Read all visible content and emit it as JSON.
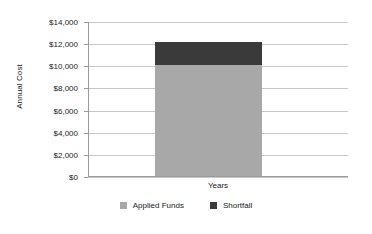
{
  "chart_data": {
    "type": "bar",
    "subtype": "stacked-column",
    "title": "",
    "xlabel": "Years",
    "ylabel": "Annual Cost",
    "categories": [
      "Years"
    ],
    "series": [
      {
        "name": "Applied Funds",
        "values": [
          10000
        ],
        "color": "#a8a8a8"
      },
      {
        "name": "Shortfall",
        "values": [
          2150
        ],
        "color": "#3a3a3a"
      }
    ],
    "stack_total": [
      12150
    ],
    "ylim": [
      0,
      14000
    ],
    "ytick_values": [
      14000,
      12000,
      10000,
      8000,
      6000,
      4000,
      2000,
      0
    ],
    "ytick_labels": [
      "$14,000",
      "$12,000",
      "$10,000",
      "$8,000",
      "$6,000",
      "$4,000",
      "$2,000",
      "$0"
    ],
    "grid": true,
    "grid_axis": "y",
    "legend": true,
    "legend_position": "bottom"
  },
  "legend": {
    "entries": [
      {
        "label": "Applied Funds",
        "color": "#a8a8a8"
      },
      {
        "label": "Shortfall",
        "color": "#3a3a3a"
      }
    ]
  },
  "axes": {
    "y_title": "Annual Cost",
    "x_category": "Years"
  },
  "colors": {
    "applied_funds": "#a8a8a8",
    "shortfall": "#3a3a3a",
    "gridline": "#c8c8c8",
    "axis": "#9a9a9a",
    "text": "#1a1a1a",
    "background": "#ffffff"
  }
}
